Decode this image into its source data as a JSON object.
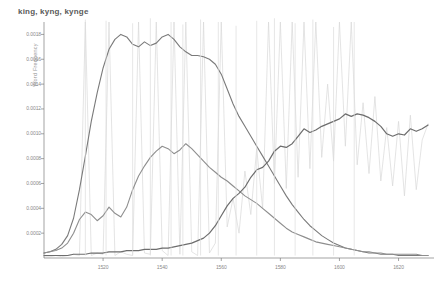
{
  "chart_data": {
    "type": "line",
    "title": "king, kyng, kynge",
    "subtitle": "",
    "xlabel": "",
    "ylabel": "Word Frequency",
    "xlim": [
      1500,
      1632
    ],
    "ylim": [
      0,
      0.0019
    ],
    "grid": false,
    "legend_position": "none",
    "x_ticks": [
      "1520",
      "1540",
      "1560",
      "1580",
      "1600",
      "1620"
    ],
    "x_tick_values": [
      1520,
      1540,
      1560,
      1580,
      1600,
      1620
    ],
    "y_ticks": [
      "0.0002",
      "0.0004",
      "0.0006",
      "0.0008",
      "0.0010",
      "0.0012",
      "0.0014",
      "0.0016",
      "0.0018"
    ],
    "y_tick_values": [
      0.0002,
      0.0004,
      0.0006,
      0.0008,
      0.001,
      0.0012,
      0.0014,
      0.0016,
      0.0018
    ],
    "x": [
      1500,
      1502,
      1504,
      1506,
      1508,
      1510,
      1512,
      1514,
      1516,
      1518,
      1520,
      1522,
      1524,
      1526,
      1528,
      1530,
      1532,
      1534,
      1536,
      1538,
      1540,
      1542,
      1544,
      1546,
      1548,
      1550,
      1552,
      1554,
      1556,
      1558,
      1560,
      1562,
      1564,
      1566,
      1568,
      1570,
      1572,
      1574,
      1576,
      1578,
      1580,
      1582,
      1584,
      1586,
      1588,
      1590,
      1592,
      1594,
      1596,
      1598,
      1600,
      1602,
      1604,
      1606,
      1608,
      1610,
      1612,
      1614,
      1616,
      1618,
      1620,
      1622,
      1624,
      1626,
      1628,
      1630
    ],
    "series": [
      {
        "name": "kyng",
        "color": "#7a7a7a",
        "linewidth": 1.1,
        "values": [
          4e-05,
          5e-05,
          7e-05,
          0.00011,
          0.00018,
          0.00032,
          0.00055,
          0.00082,
          0.0011,
          0.00133,
          0.00153,
          0.00168,
          0.00176,
          0.0018,
          0.00178,
          0.00172,
          0.0017,
          0.00174,
          0.00171,
          0.00173,
          0.00178,
          0.0018,
          0.00176,
          0.0017,
          0.00166,
          0.00163,
          0.00163,
          0.00162,
          0.0016,
          0.00156,
          0.00148,
          0.00136,
          0.00124,
          0.00114,
          0.00106,
          0.00098,
          0.0009,
          0.00082,
          0.00074,
          0.00066,
          0.00058,
          0.0005,
          0.00043,
          0.00037,
          0.00031,
          0.00026,
          0.00022,
          0.00018,
          0.00015,
          0.00012,
          0.0001,
          8e-05,
          7e-05,
          6e-05,
          5e-05,
          4e-05,
          4e-05,
          3e-05,
          3e-05,
          3e-05,
          2e-05,
          2e-05,
          2e-05,
          2e-05,
          2e-05,
          2e-05
        ]
      },
      {
        "name": "kynge",
        "color": "#8e8e8e",
        "linewidth": 1.1,
        "values": [
          4e-05,
          5e-05,
          6e-05,
          8e-05,
          0.00012,
          0.0002,
          0.00031,
          0.00037,
          0.00035,
          0.0003,
          0.00034,
          0.00041,
          0.00036,
          0.00033,
          0.00041,
          0.00055,
          0.00066,
          0.00074,
          0.00081,
          0.00086,
          0.0009,
          0.00088,
          0.00084,
          0.00087,
          0.00092,
          0.00088,
          0.00083,
          0.00078,
          0.00073,
          0.00069,
          0.00065,
          0.00062,
          0.00058,
          0.00054,
          0.0005,
          0.00047,
          0.00044,
          0.0004,
          0.00036,
          0.00032,
          0.00028,
          0.00024,
          0.00021,
          0.00019,
          0.00017,
          0.00015,
          0.00013,
          0.00012,
          0.00011,
          0.0001,
          9e-05,
          8e-05,
          7e-05,
          6e-05,
          5e-05,
          5e-05,
          4e-05,
          4e-05,
          3e-05,
          3e-05,
          3e-05,
          3e-05,
          3e-05,
          3e-05,
          2e-05,
          2e-05
        ]
      },
      {
        "name": "king",
        "color": "#6d6d6d",
        "linewidth": 1.2,
        "values": [
          2e-05,
          2e-05,
          2e-05,
          2e-05,
          2e-05,
          3e-05,
          3e-05,
          3e-05,
          4e-05,
          4e-05,
          4e-05,
          5e-05,
          5e-05,
          5e-05,
          6e-05,
          6e-05,
          6e-05,
          7e-05,
          7e-05,
          7e-05,
          8e-05,
          8e-05,
          9e-05,
          0.0001,
          0.00011,
          0.00012,
          0.00014,
          0.00016,
          0.0002,
          0.00026,
          0.00034,
          0.00042,
          0.00048,
          0.00052,
          0.00057,
          0.00065,
          0.00071,
          0.00073,
          0.00078,
          0.00086,
          0.0009,
          0.00089,
          0.00092,
          0.00098,
          0.00104,
          0.00101,
          0.00103,
          0.00106,
          0.00108,
          0.0011,
          0.00112,
          0.00116,
          0.00114,
          0.00116,
          0.00115,
          0.00113,
          0.0011,
          0.00106,
          0.001,
          0.00098,
          0.001,
          0.00099,
          0.00104,
          0.00102,
          0.00104,
          0.00107
        ]
      },
      {
        "name": "king-raw",
        "color": "#d8d8d8",
        "linewidth": 0.7,
        "values": [
          1e-05,
          1e-05,
          2e-05,
          1e-05,
          2e-05,
          3e-05,
          2e-05,
          0.0019,
          2e-05,
          4e-05,
          3e-05,
          0.0019,
          2e-05,
          5e-05,
          3e-05,
          2e-05,
          0.0019,
          4e-05,
          3e-05,
          0.0019,
          6e-05,
          2e-05,
          0.0019,
          3e-05,
          0.0019,
          5e-05,
          2e-05,
          0.0019,
          4e-05,
          0.00012,
          0.0019,
          0.00025,
          0.00048,
          0.0002,
          0.0007,
          0.00035,
          0.00088,
          0.0004,
          0.0019,
          0.0006,
          0.0019,
          0.00056,
          0.0019,
          0.00065,
          0.0019,
          0.00072,
          0.0019,
          0.00081,
          0.0014,
          0.00078,
          0.0019,
          0.0009,
          0.0019,
          0.00075,
          0.00125,
          0.00068,
          0.0013,
          0.00062,
          0.00105,
          0.00058,
          0.0011,
          0.0005,
          0.00115,
          0.00055,
          0.00095,
          0.00108
        ]
      }
    ],
    "raw_spikes": [
      {
        "x": 1514,
        "y": 0.00192
      },
      {
        "x": 1521,
        "y": 0.00191
      },
      {
        "x": 1530,
        "y": 0.00189
      },
      {
        "x": 1536,
        "y": 0.00193
      },
      {
        "x": 1543,
        "y": 0.0019
      },
      {
        "x": 1547,
        "y": 0.00188
      },
      {
        "x": 1553,
        "y": 0.00192
      },
      {
        "x": 1559,
        "y": 0.0019
      },
      {
        "x": 1565,
        "y": 0.00187
      },
      {
        "x": 1572,
        "y": 0.00191
      },
      {
        "x": 1578,
        "y": 0.00193
      },
      {
        "x": 1585,
        "y": 0.00189
      },
      {
        "x": 1591,
        "y": 0.00192
      },
      {
        "x": 1598,
        "y": 0.00186
      },
      {
        "x": 1605,
        "y": 0.0019
      }
    ]
  }
}
